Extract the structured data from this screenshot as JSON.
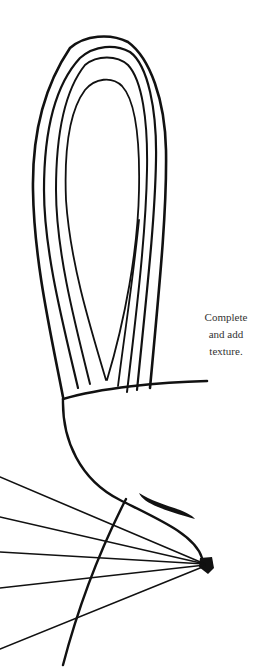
{
  "page": {
    "background": "#ffffff",
    "ink_color": "#111111"
  },
  "caption": {
    "lines": [
      "Complete",
      "and add",
      "texture."
    ]
  },
  "illustration": {
    "subject": "bird-outline-drawing",
    "parts": [
      "tail-feather-loops",
      "body-baseline",
      "head-curve",
      "eye-mark",
      "beak",
      "radiating-lines"
    ]
  }
}
